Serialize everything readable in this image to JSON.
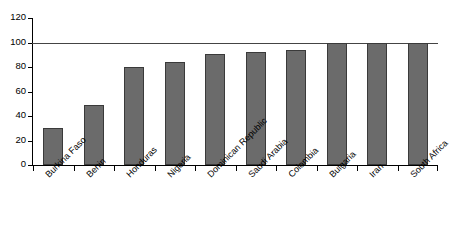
{
  "chart_data": {
    "type": "bar",
    "title": "",
    "subtitle": "",
    "xlabel": "",
    "ylabel": "",
    "categories": [
      "Burkina Faso",
      "Benin",
      "Honduras",
      "Nigeria",
      "Dominican Republic",
      "Saudi Arabia",
      "Colombia",
      "Bulgaria",
      "Iran",
      "South Africa"
    ],
    "values": [
      30,
      49,
      80,
      84,
      91,
      92,
      94,
      100,
      100,
      100
    ],
    "ylim": [
      0,
      120
    ],
    "ytick_labels": [
      "0",
      "20",
      "40",
      "60",
      "80",
      "100",
      "120"
    ],
    "ytick_values": [
      0,
      20,
      40,
      60,
      80,
      100,
      120
    ],
    "grid": false,
    "legend": "none",
    "reference_line": 100,
    "bar_fill_color": "#6b6b6b",
    "bar_border_color": "#3a3a3a",
    "axis_color": "#000000",
    "reference_line_color": "#444444",
    "background_color": "#ffffff",
    "xtick_label_rotation": -45
  }
}
